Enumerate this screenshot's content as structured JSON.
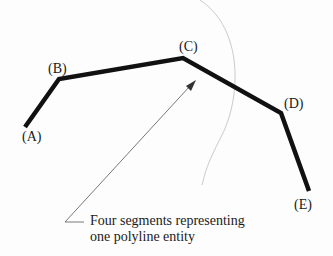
{
  "diagram": {
    "points": [
      {
        "id": "A",
        "label": "(A)",
        "x": 25,
        "y": 127
      },
      {
        "id": "B",
        "label": "(B)",
        "x": 59,
        "y": 79
      },
      {
        "id": "C",
        "label": "(C)",
        "x": 183,
        "y": 58
      },
      {
        "id": "D",
        "label": "(D)",
        "x": 281,
        "y": 113
      },
      {
        "id": "E",
        "label": "(E)",
        "x": 309,
        "y": 191
      }
    ],
    "labels": {
      "A": "(A)",
      "B": "(B)",
      "C": "(C)",
      "D": "(D)",
      "E": "(E)"
    },
    "caption": {
      "line1": "Four segments representing",
      "line2": "one polyline entity"
    },
    "colors": {
      "polyline": "#111111",
      "leader": "#555555",
      "arc": "#bbbbbb",
      "text": "#1a1a1a"
    }
  }
}
